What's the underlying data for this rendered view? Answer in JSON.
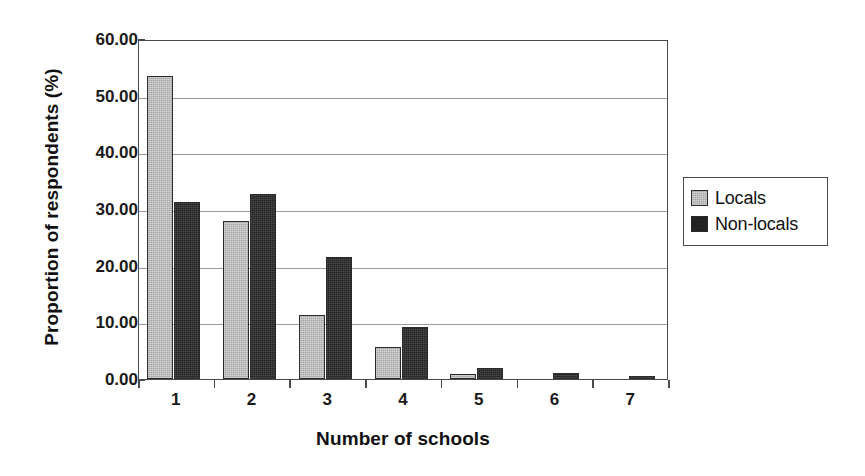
{
  "chart_data": {
    "type": "bar",
    "title": "",
    "xlabel": "Number of schools",
    "ylabel": "Proportion of respondents (%)",
    "categories": [
      "1",
      "2",
      "3",
      "4",
      "5",
      "6",
      "7"
    ],
    "series": [
      {
        "name": "Locals",
        "color": "#a8a8a8",
        "values": [
          53.5,
          27.8,
          11.3,
          5.6,
          0.8,
          0.0,
          0.0
        ]
      },
      {
        "name": "Non-locals",
        "color": "#232323",
        "values": [
          31.2,
          32.7,
          21.6,
          9.2,
          1.9,
          1.1,
          0.4
        ]
      }
    ],
    "ylim": [
      0,
      60
    ],
    "ytick_values": [
      0,
      10,
      20,
      30,
      40,
      50,
      60
    ],
    "ytick_labels": [
      "0.00",
      "10.00",
      "20.00",
      "30.00",
      "40.00",
      "50.00",
      "60.00"
    ],
    "grid": "horizontal",
    "legend_position": "right-outside",
    "legend_entries": [
      "Locals",
      "Non-locals"
    ]
  }
}
